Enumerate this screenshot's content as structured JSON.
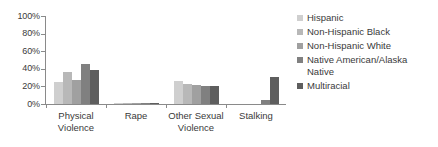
{
  "chart_data": {
    "type": "bar",
    "title": "",
    "subtitle": "",
    "xlabel": "",
    "ylabel": "",
    "ylim": [
      0,
      100
    ],
    "grid": false,
    "legend_position": "right",
    "categories": [
      "Physical Violence",
      "Rape",
      "Other Sexual Violence",
      "Stalking"
    ],
    "category_lines": [
      [
        "Physical",
        "Violence"
      ],
      [
        "Rape"
      ],
      [
        "Other Sexual",
        "Violence"
      ],
      [
        "Stalking"
      ]
    ],
    "ytick_labels": [
      "100%",
      "80%",
      "60%",
      "40%",
      "20%",
      "0%"
    ],
    "ytick_values": [
      100,
      80,
      60,
      40,
      20,
      0
    ],
    "series": [
      {
        "name": "Hispanic",
        "color": "#cfcfcf",
        "values": [
          25,
          0.5,
          26,
          0
        ]
      },
      {
        "name": "Non-Hispanic Black",
        "color": "#b8b8b8",
        "values": [
          36,
          0.5,
          23,
          0
        ]
      },
      {
        "name": "Non-Hispanic White",
        "color": "#a0a0a0",
        "values": [
          27,
          0.7,
          22,
          0
        ]
      },
      {
        "name": "Native American/Alaska Native",
        "color": "#808080",
        "values": [
          45,
          0.5,
          21,
          5
        ]
      },
      {
        "name": "Multiracial",
        "color": "#5e5e5e",
        "values": [
          39,
          0.5,
          21,
          31
        ]
      }
    ]
  },
  "legend": {
    "items": [
      {
        "label": "Hispanic",
        "color": "#cfcfcf"
      },
      {
        "label": "Non-Hispanic Black",
        "color": "#b8b8b8"
      },
      {
        "label": "Non-Hispanic White",
        "color": "#a0a0a0"
      },
      {
        "label": "Native American/Alaska\nNative",
        "color": "#808080"
      },
      {
        "label": "Multiracial",
        "color": "#5e5e5e"
      }
    ]
  }
}
